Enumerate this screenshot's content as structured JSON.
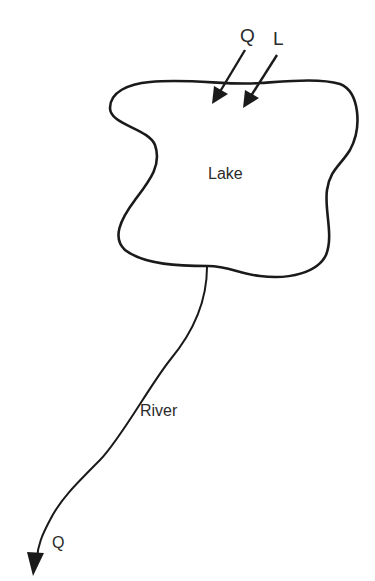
{
  "diagram": {
    "type": "lake-river mass balance schematic",
    "labels": {
      "inflow_q": "Q",
      "load_l": "L",
      "lake": "Lake",
      "river": "River",
      "outflow_q": "Q"
    },
    "colors": {
      "stroke": "#1a1a1a",
      "text": "#2a2a2a",
      "background": "#ffffff"
    },
    "elements": [
      {
        "id": "lake",
        "kind": "closed-outline",
        "label": "Lake"
      },
      {
        "id": "inflow-q-arrow",
        "kind": "arrow",
        "label": "Q",
        "direction": "into lake"
      },
      {
        "id": "load-l-arrow",
        "kind": "arrow",
        "label": "L",
        "direction": "into lake"
      },
      {
        "id": "river",
        "kind": "curve",
        "label": "River",
        "from": "lake bottom"
      },
      {
        "id": "outflow-q-arrow",
        "kind": "arrow",
        "label": "Q",
        "direction": "out of river"
      }
    ]
  }
}
